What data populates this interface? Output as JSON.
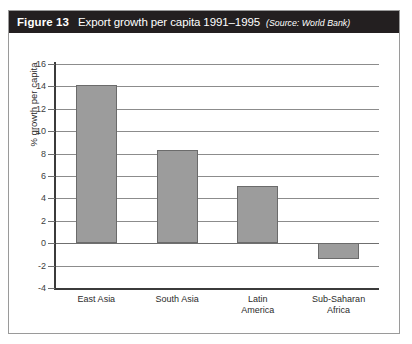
{
  "figure": {
    "number": "Figure 13",
    "caption": "Export growth per capita 1991–1995",
    "source": "(Source: World Bank)"
  },
  "colors": {
    "header_background": "#231f20",
    "header_text": "#ffffff",
    "bar_fill": "#9c9c9c",
    "bar_stroke": "#6b6b6b",
    "gridline": "#8c8c8c",
    "axis": "#3b3b3b",
    "card_border": "#9a9a9a",
    "page_background": "#ffffff"
  },
  "chart_data": {
    "type": "bar",
    "title": "Export growth per capita 1991–1995",
    "categories": [
      "East Asia",
      "South Asia",
      "Latin America",
      "Sub-Saharan Africa"
    ],
    "category_lines": [
      [
        "East Asia"
      ],
      [
        "South Asia"
      ],
      [
        "Latin",
        "America"
      ],
      [
        "Sub-Saharan",
        "Africa"
      ]
    ],
    "values": [
      14.1,
      8.3,
      5.1,
      -1.4
    ],
    "xlabel": "",
    "ylabel": "% growth per capita",
    "ylim": [
      -4,
      16
    ],
    "ytick_step": 2,
    "yticks": [
      16,
      14,
      12,
      10,
      8,
      6,
      4,
      2,
      0,
      -2,
      -4
    ],
    "ytick_labels": [
      "16",
      "14",
      "12",
      "10",
      "8",
      "6",
      "4",
      "2",
      "0",
      "-2",
      "-4"
    ],
    "grid": true,
    "grid_axis": "y",
    "legend": false,
    "series": [
      {
        "name": "Export growth per capita",
        "values": [
          14.1,
          8.3,
          5.1,
          -1.4
        ]
      }
    ]
  }
}
